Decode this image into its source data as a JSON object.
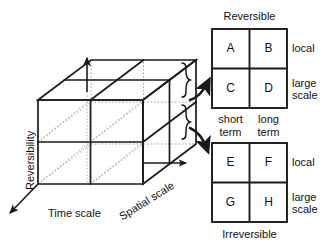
{
  "figure": {
    "type": "conceptual-cube-diagram",
    "axes": {
      "vertical_label": "Reversibility",
      "horizontal_label": "Time scale",
      "depth_label": "Spatial scale"
    },
    "cube": {
      "divisions_per_axis": 2,
      "description": "2x2x2 subdivided box"
    },
    "matrices": [
      {
        "id": "reversible",
        "title": "Reversible",
        "title_position": "top",
        "columns": [
          "short term",
          "long term"
        ],
        "rows": [
          "local",
          "large scale"
        ],
        "cells": [
          [
            "A",
            "B"
          ],
          [
            "C",
            "D"
          ]
        ]
      },
      {
        "id": "irreversible",
        "title": "Irreversible",
        "title_position": "bottom",
        "columns": [
          "short term",
          "long term"
        ],
        "rows": [
          "local",
          "large scale"
        ],
        "cells": [
          [
            "E",
            "F"
          ],
          [
            "G",
            "H"
          ]
        ]
      }
    ],
    "column_labels": {
      "left_line1": "short",
      "left_line2": "term",
      "right_line1": "long",
      "right_line2": "term"
    },
    "row_labels": {
      "top": "local",
      "bottom_line1": "large",
      "bottom_line2": "scale"
    },
    "connectors": [
      {
        "name": "upper-brace-arrow",
        "target": "reversible"
      },
      {
        "name": "lower-brace-arrow",
        "target": "irreversible"
      }
    ],
    "colors": {
      "stroke": "#1a1a1a",
      "hidden_stroke": "#8c8c8c",
      "background": "#ffffff",
      "text": "#111111"
    }
  }
}
